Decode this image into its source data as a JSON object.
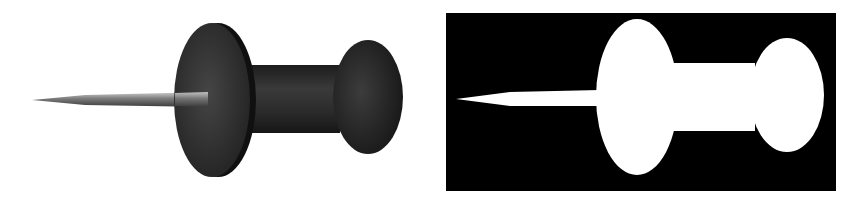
{
  "figure": {
    "panels": [
      {
        "id": "photo",
        "description": "Grayscale photograph of a pushpin (thumbtack) viewed from the side",
        "colors": {
          "background": "#ffffff",
          "body": "#2b2b2b",
          "needle": "#8a8a8a"
        }
      },
      {
        "id": "mask",
        "description": "Binary silhouette mask of the same pushpin, white on black",
        "colors": {
          "background": "#000000",
          "foreground": "#ffffff"
        }
      }
    ]
  }
}
